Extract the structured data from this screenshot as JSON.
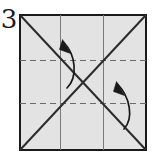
{
  "figure": {
    "kind": "origami-fold-diagram",
    "step_label": "3",
    "canvas": {
      "width": 156,
      "height": 165
    },
    "background_color": "#ffffff"
  },
  "paper": {
    "name": "square-sheet",
    "fill_color": "#e3e3e3",
    "edge_color": "#1a1a1a",
    "edge_width": 2,
    "x": 19,
    "y": 14,
    "width": 127,
    "height": 136
  },
  "crease_lines": {
    "solid_color": "#2b2b2b",
    "dashed_color": "#6b6b6b",
    "solid_width": 2,
    "grid_width": 1,
    "dash_pattern": "5,4",
    "diagonals": [
      {
        "name": "diagonal-tl-br",
        "x1": 19,
        "y1": 14,
        "x2": 146,
        "y2": 150,
        "style": "solid"
      },
      {
        "name": "diagonal-bl-tr",
        "x1": 19,
        "y1": 150,
        "x2": 146,
        "y2": 14,
        "style": "solid"
      }
    ],
    "verticals": [
      {
        "name": "vertical-crease-left",
        "x": 60,
        "y1": 14,
        "y2": 150,
        "style": "solid"
      },
      {
        "name": "vertical-crease-right",
        "x": 103,
        "y1": 14,
        "y2": 150,
        "style": "solid"
      }
    ],
    "horizontals": [
      {
        "name": "horizontal-fold-upper",
        "y": 60,
        "x1": 19,
        "x2": 146,
        "style": "dashed"
      },
      {
        "name": "horizontal-fold-lower",
        "y": 103,
        "x1": 19,
        "x2": 146,
        "style": "dashed"
      }
    ]
  },
  "arrows": {
    "color": "#1a1a1a",
    "stroke_width": 1.6,
    "items": [
      {
        "name": "fold-arrow-upper-left",
        "direction": "up",
        "path": "M 67 88 C 77 78 76 56 64 41",
        "head": "M 64 41 L 70 52 L 61 50 Z"
      },
      {
        "name": "fold-arrow-lower-right",
        "direction": "up",
        "path": "M 123 128 C 133 118 130 98 117 84",
        "head": "M 117 84 L 123 95 L 114 93 Z"
      }
    ]
  }
}
